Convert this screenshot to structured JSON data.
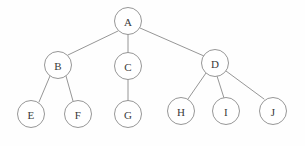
{
  "diagram": {
    "type": "tree-graph",
    "background_color": "#fefefe",
    "stroke_color": "#8a8a8a",
    "label_color": "#3a3a3a",
    "node_fill": "#ffffff",
    "node_radius": 13.5,
    "nodes": [
      {
        "id": "A",
        "label": "A",
        "cx": 128,
        "cy": 21,
        "r": 13.5,
        "level": 0
      },
      {
        "id": "B",
        "label": "B",
        "cx": 58,
        "cy": 65,
        "r": 13.5,
        "level": 1
      },
      {
        "id": "C",
        "label": "C",
        "cx": 128,
        "cy": 66,
        "r": 13.5,
        "level": 1
      },
      {
        "id": "D",
        "label": "D",
        "cx": 215,
        "cy": 63,
        "r": 13.5,
        "level": 1
      },
      {
        "id": "E",
        "label": "E",
        "cx": 31,
        "cy": 114,
        "r": 13.5,
        "level": 2
      },
      {
        "id": "F",
        "label": "F",
        "cx": 78,
        "cy": 114,
        "r": 13.5,
        "level": 2
      },
      {
        "id": "G",
        "label": "G",
        "cx": 128,
        "cy": 114,
        "r": 13.5,
        "level": 2
      },
      {
        "id": "H",
        "label": "H",
        "cx": 181,
        "cy": 111,
        "r": 13.5,
        "level": 2
      },
      {
        "id": "I",
        "label": "I",
        "cx": 226,
        "cy": 111,
        "r": 13.5,
        "level": 2
      },
      {
        "id": "J",
        "label": "J",
        "cx": 273,
        "cy": 111,
        "r": 13.5,
        "level": 2
      }
    ],
    "edges": [
      {
        "from": "A",
        "to": "B",
        "x1": 118,
        "y1": 31,
        "x2": 68,
        "y2": 55
      },
      {
        "from": "A",
        "to": "C",
        "x1": 128,
        "y1": 34,
        "x2": 128,
        "y2": 53
      },
      {
        "from": "A",
        "to": "D",
        "x1": 140,
        "y1": 28,
        "x2": 204,
        "y2": 56
      },
      {
        "from": "B",
        "to": "E",
        "x1": 50,
        "y1": 76,
        "x2": 39,
        "y2": 102
      },
      {
        "from": "B",
        "to": "F",
        "x1": 66,
        "y1": 76,
        "x2": 73,
        "y2": 101
      },
      {
        "from": "C",
        "to": "G",
        "x1": 128,
        "y1": 79,
        "x2": 128,
        "y2": 101
      },
      {
        "from": "D",
        "to": "H",
        "x1": 206,
        "y1": 73,
        "x2": 188,
        "y2": 99
      },
      {
        "from": "D",
        "to": "I",
        "x1": 217,
        "y1": 76,
        "x2": 224,
        "y2": 98
      },
      {
        "from": "D",
        "to": "J",
        "x1": 226,
        "y1": 71,
        "x2": 264,
        "y2": 99
      }
    ]
  }
}
